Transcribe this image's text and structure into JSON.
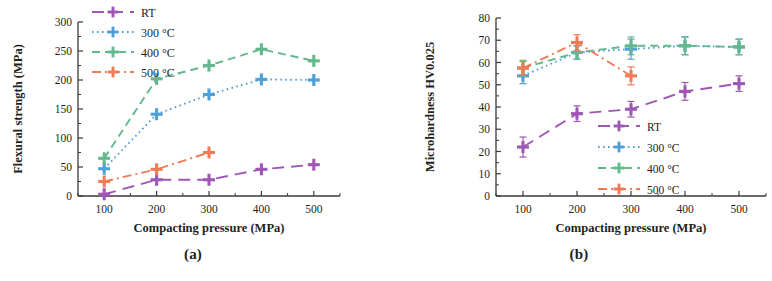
{
  "figure": {
    "panels": [
      {
        "caption": "(a)"
      },
      {
        "caption": "(b)"
      }
    ]
  },
  "chart_data": [
    {
      "type": "line",
      "panel": "(a)",
      "title": "",
      "xlabel": "Compacting pressure (MPa)",
      "ylabel": "Flexural strength (MPa)",
      "x": [
        100,
        200,
        300,
        400,
        500
      ],
      "xticklabels": [
        "100",
        "200",
        "300",
        "400",
        "500"
      ],
      "xlim": [
        50,
        550
      ],
      "ylim": [
        0,
        300
      ],
      "yticks": [
        0,
        50,
        100,
        150,
        200,
        250,
        300
      ],
      "yticklabels": [
        "0",
        "50",
        "100",
        "150",
        "200",
        "250",
        "300"
      ],
      "grid": false,
      "legend_position": "top-left",
      "error_bars": false,
      "series": [
        {
          "name": "RT",
          "color": "#9e57b5",
          "dash": "12,7",
          "marker": "plus",
          "x": [
            100,
            200,
            300,
            400,
            500
          ],
          "values": [
            3,
            28,
            28,
            46,
            54
          ]
        },
        {
          "name": "300 °C",
          "color": "#4f9fd8",
          "dash": "1.6,3.4",
          "marker": "plus",
          "x": [
            100,
            200,
            300,
            400,
            500
          ],
          "values": [
            47,
            141,
            175,
            201,
            200
          ]
        },
        {
          "name": "400 °C",
          "color": "#63b98c",
          "dash": "8,5",
          "marker": "plus",
          "x": [
            100,
            200,
            300,
            400,
            500
          ],
          "values": [
            65,
            202,
            225,
            253,
            233
          ]
        },
        {
          "name": "500 °C",
          "color": "#ef7b57",
          "dash": "9,4,2,4",
          "marker": "plus",
          "x": [
            100,
            200,
            300
          ],
          "values": [
            25,
            46,
            75
          ]
        }
      ]
    },
    {
      "type": "line",
      "panel": "(b)",
      "title": "",
      "xlabel": "Compacting pressure (MPa)",
      "ylabel": "Microhardness HV0.025",
      "x": [
        100,
        200,
        300,
        400,
        500
      ],
      "xticklabels": [
        "100",
        "200",
        "300",
        "400",
        "500"
      ],
      "xlim": [
        50,
        550
      ],
      "ylim": [
        0,
        80
      ],
      "yticks": [
        0,
        10,
        20,
        30,
        40,
        50,
        60,
        70,
        80
      ],
      "yticklabels": [
        "0",
        "10",
        "20",
        "30",
        "40",
        "50",
        "60",
        "70",
        "80"
      ],
      "grid": false,
      "legend_position": "bottom-right",
      "error_bars": true,
      "series": [
        {
          "name": "RT",
          "color": "#9e57b5",
          "dash": "12,7",
          "marker": "plus",
          "x": [
            100,
            200,
            300,
            400,
            500
          ],
          "values": [
            22,
            37,
            39,
            47,
            50.5
          ],
          "errors": [
            4.5,
            3.5,
            3.5,
            4,
            3.5
          ]
        },
        {
          "name": "300 °C",
          "color": "#4f9fd8",
          "dash": "1.6,3.4",
          "marker": "plus",
          "x": [
            100,
            200,
            300,
            400,
            500
          ],
          "values": [
            54,
            64.5,
            66,
            67.5,
            67
          ],
          "errors": [
            3.5,
            3,
            4.5,
            4,
            3.5
          ]
        },
        {
          "name": "400 °C",
          "color": "#63b98c",
          "dash": "8,5",
          "marker": "plus",
          "x": [
            100,
            200,
            300,
            400,
            500
          ],
          "values": [
            57.5,
            64.5,
            67.5,
            67.5,
            67
          ],
          "errors": [
            3.5,
            3,
            4,
            4,
            3.5
          ]
        },
        {
          "name": "500 °C",
          "color": "#ef7b57",
          "dash": "9,4,2,4",
          "marker": "plus",
          "x": [
            100,
            200,
            300
          ],
          "values": [
            57.5,
            69,
            54
          ],
          "errors": [
            3,
            3.5,
            4
          ]
        }
      ]
    }
  ]
}
